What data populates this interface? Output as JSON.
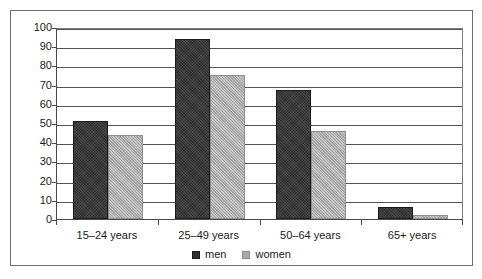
{
  "chart_data": {
    "type": "bar",
    "title": "",
    "subtitle": "",
    "xlabel": "",
    "ylabel": "",
    "categories": [
      "15–24 years",
      "25–49 years",
      "50–64 years",
      "65+ years"
    ],
    "series": [
      {
        "name": "men",
        "color": "#2f2f2f",
        "values": [
          51,
          94,
          67,
          6
        ]
      },
      {
        "name": "women",
        "color": "#a9a9a9",
        "values": [
          44,
          75,
          46,
          2
        ]
      }
    ],
    "ylim": [
      0,
      100
    ],
    "ytick_step": 10,
    "yticks": [
      100,
      90,
      80,
      70,
      60,
      50,
      40,
      30,
      20,
      10,
      0
    ],
    "grid": true,
    "grid_axis": "y",
    "legend_position": "bottom-center",
    "legend_entries": [
      "men",
      "women"
    ]
  },
  "frame": {
    "border_color": "#6e6e6e",
    "background": "#ffffff"
  },
  "icons": {
    "legend_swatch_men": "filled-square-dark",
    "legend_swatch_women": "filled-square-gray"
  }
}
